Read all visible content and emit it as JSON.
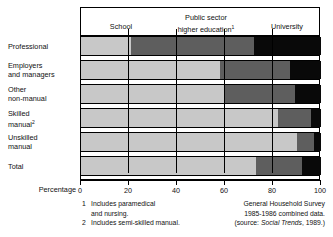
{
  "figure": {
    "axis_title": "Percentage",
    "row_label_note_marker": "1"
  },
  "legend_headers": {
    "school": "School",
    "public_sector_line1": "Public sector",
    "public_sector_line2": "higher education",
    "public_sector_superscript": "1",
    "university": "University"
  },
  "rows": [
    {
      "line1": "Professional",
      "line2": "",
      "sup": ""
    },
    {
      "line1": "Employers",
      "line2": "and managers",
      "sup": ""
    },
    {
      "line1": "Other",
      "line2": "non-manual",
      "sup": ""
    },
    {
      "line1": "Skilled",
      "line2": "manual",
      "sup": "2"
    },
    {
      "line1": "Unskilled",
      "line2": "manual",
      "sup": ""
    },
    {
      "line1": "Total",
      "line2": "",
      "sup": ""
    }
  ],
  "ticks": [
    "0",
    "20",
    "40",
    "60",
    "80",
    "100"
  ],
  "footnotes": [
    {
      "num": "1",
      "text": "Includes paramedical",
      "cont": "and nursing."
    },
    {
      "num": "2",
      "text": "Includes semi-skilled manual.",
      "cont": ""
    }
  ],
  "source": {
    "line1": "General Household Survey",
    "line2": "1985-1986 combined data.",
    "line3_pre": "(source: ",
    "line3_italic": "Social Trends",
    "line3_post": ", 1989.)"
  },
  "colors": {
    "school": "#c8c8c8",
    "public_sector": "#5e5e5e",
    "university": "#090909",
    "frame": "#000000"
  },
  "chart_data": {
    "type": "bar",
    "orientation": "horizontal",
    "stacked": true,
    "normalized": true,
    "title": "",
    "xlabel": "Percentage",
    "ylabel": "",
    "xlim": [
      0,
      100
    ],
    "xticks": [
      0,
      20,
      40,
      60,
      80,
      100
    ],
    "grid": true,
    "legend_position": "top",
    "categories": [
      "Professional",
      "Employers and managers",
      "Other non-manual",
      "Skilled manual",
      "Unskilled manual",
      "Total"
    ],
    "series": [
      {
        "name": "School",
        "values": [
          21,
          58,
          60,
          82,
          90,
          73
        ]
      },
      {
        "name": "Public sector higher education",
        "values": [
          51,
          29,
          29,
          14,
          7,
          19
        ]
      },
      {
        "name": "University",
        "values": [
          28,
          13,
          11,
          4,
          3,
          8
        ]
      }
    ],
    "cumulative_boundaries": [
      [
        21,
        72
      ],
      [
        58,
        87
      ],
      [
        60,
        89
      ],
      [
        82,
        96
      ],
      [
        90,
        97
      ],
      [
        73,
        92
      ]
    ]
  }
}
